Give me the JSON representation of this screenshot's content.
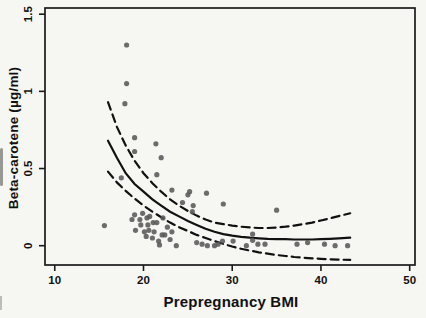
{
  "figure": {
    "background": "#f6f6f3",
    "axis_color": "#1a1a1a",
    "tick_label_color": "#111111",
    "point_color": "#595959",
    "curve_color": "#111111"
  },
  "chart_data": {
    "type": "scatter",
    "title": "",
    "xlabel": "Prepregnancy BMI",
    "ylabel": "Beta-carotene (µg/ml)",
    "xlim": [
      8.9,
      50.6
    ],
    "ylim": [
      -0.125,
      1.54
    ],
    "x_ticks": [
      10,
      20,
      30,
      40,
      50
    ],
    "x_tick_labels": [
      "10",
      "20",
      "30",
      "40",
      "50"
    ],
    "y_ticks": [
      0,
      0.5,
      1,
      1.5
    ],
    "y_tick_labels": [
      "0",
      "0.5",
      "1",
      "1.5"
    ],
    "grid": false,
    "legend": "none",
    "points": [
      [
        18.1,
        1.3
      ],
      [
        18.1,
        1.05
      ],
      [
        17.9,
        0.92
      ],
      [
        19.0,
        0.7
      ],
      [
        19.0,
        0.61
      ],
      [
        21.4,
        0.66
      ],
      [
        22.0,
        0.57
      ],
      [
        21.5,
        0.46
      ],
      [
        17.5,
        0.44
      ],
      [
        15.6,
        0.13
      ],
      [
        23.2,
        0.36
      ],
      [
        25.2,
        0.35
      ],
      [
        25.0,
        0.33
      ],
      [
        27.1,
        0.34
      ],
      [
        24.4,
        0.28
      ],
      [
        25.6,
        0.26
      ],
      [
        25.5,
        0.22
      ],
      [
        22.2,
        0.18
      ],
      [
        29.0,
        0.27
      ],
      [
        35.0,
        0.23
      ],
      [
        18.7,
        0.17
      ],
      [
        19.0,
        0.2
      ],
      [
        19.9,
        0.21
      ],
      [
        19.6,
        0.17
      ],
      [
        20.4,
        0.18
      ],
      [
        20.7,
        0.19
      ],
      [
        21.1,
        0.15
      ],
      [
        19.7,
        0.135
      ],
      [
        20.5,
        0.135
      ],
      [
        21.5,
        0.15
      ],
      [
        19.1,
        0.1
      ],
      [
        20.1,
        0.09
      ],
      [
        20.6,
        0.1
      ],
      [
        21.2,
        0.09
      ],
      [
        20.3,
        0.06
      ],
      [
        21.0,
        0.05
      ],
      [
        21.7,
        0.03
      ],
      [
        22.1,
        0.07
      ],
      [
        22.7,
        0.12
      ],
      [
        23.2,
        0.09
      ],
      [
        22.4,
        0.07
      ],
      [
        23.0,
        0.04
      ],
      [
        21.8,
        0.005
      ],
      [
        23.7,
        0.0
      ],
      [
        26.0,
        0.02
      ],
      [
        26.6,
        0.01
      ],
      [
        27.2,
        0.0
      ],
      [
        28.0,
        0.0
      ],
      [
        28.4,
        0.01
      ],
      [
        28.9,
        0.03
      ],
      [
        30.1,
        0.03
      ],
      [
        31.6,
        0.0
      ],
      [
        32.3,
        0.035
      ],
      [
        32.3,
        0.075
      ],
      [
        32.9,
        0.01
      ],
      [
        33.7,
        0.01
      ],
      [
        37.3,
        0.01
      ],
      [
        38.5,
        0.02
      ],
      [
        40.4,
        0.01
      ],
      [
        41.6,
        0.0
      ],
      [
        43.0,
        0.0
      ]
    ],
    "series": [
      {
        "name": "fitted-curve",
        "style": "solid",
        "x": [
          16,
          17,
          18,
          19,
          20,
          21,
          22,
          23,
          24,
          25,
          26,
          27,
          28,
          29,
          30,
          31,
          32,
          33,
          34,
          35,
          36,
          37,
          38,
          39,
          40,
          41,
          42,
          43.3
        ],
        "y": [
          0.68,
          0.57,
          0.47,
          0.4,
          0.35,
          0.3,
          0.26,
          0.22,
          0.19,
          0.16,
          0.135,
          0.11,
          0.09,
          0.075,
          0.065,
          0.058,
          0.052,
          0.048,
          0.045,
          0.043,
          0.042,
          0.04,
          0.04,
          0.04,
          0.042,
          0.045,
          0.048,
          0.052
        ]
      },
      {
        "name": "upper-confidence-band",
        "style": "dashed",
        "x": [
          16,
          17,
          18,
          19,
          20,
          21,
          22,
          23,
          24,
          25,
          26,
          27,
          28,
          29,
          30,
          31,
          32,
          33,
          34,
          35,
          36,
          37,
          38,
          39,
          40,
          41,
          42,
          43.3
        ],
        "y": [
          0.93,
          0.77,
          0.65,
          0.55,
          0.47,
          0.405,
          0.35,
          0.3,
          0.26,
          0.225,
          0.195,
          0.17,
          0.15,
          0.14,
          0.13,
          0.123,
          0.118,
          0.115,
          0.115,
          0.118,
          0.123,
          0.13,
          0.14,
          0.15,
          0.163,
          0.177,
          0.192,
          0.21
        ]
      },
      {
        "name": "lower-confidence-band",
        "style": "dashed",
        "x": [
          16,
          17,
          18,
          19,
          20,
          21,
          22,
          23,
          24,
          25,
          26,
          27,
          28,
          29,
          30,
          31,
          32,
          33,
          34,
          35,
          36,
          37,
          38,
          39,
          40,
          41,
          42,
          43.3
        ],
        "y": [
          0.48,
          0.41,
          0.355,
          0.305,
          0.26,
          0.22,
          0.185,
          0.15,
          0.12,
          0.095,
          0.07,
          0.05,
          0.03,
          0.012,
          -0.005,
          -0.02,
          -0.032,
          -0.043,
          -0.052,
          -0.06,
          -0.067,
          -0.073,
          -0.078,
          -0.082,
          -0.085,
          -0.088,
          -0.09,
          -0.092
        ]
      }
    ]
  }
}
